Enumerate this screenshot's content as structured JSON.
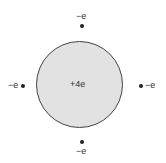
{
  "nucleus": {
    "charge_label": "+4e",
    "fill": "#e2e2e2",
    "stroke": "#444444"
  },
  "electrons": [
    {
      "position": "top",
      "label": "−e"
    },
    {
      "position": "left",
      "label": "−e"
    },
    {
      "position": "right",
      "label": "−e"
    },
    {
      "position": "bottom",
      "label": "−e"
    }
  ]
}
